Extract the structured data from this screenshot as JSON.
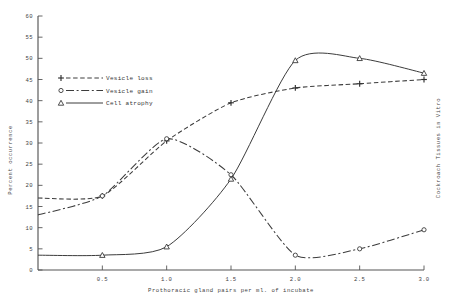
{
  "chart_data": {
    "type": "line",
    "title": "",
    "xlabel": "Prothoracic gland pairs per ml. of incubate",
    "ylabel": "Percent occurrence",
    "right_label": "Cockroach Tissues in Vitro",
    "xlim": [
      0,
      3.0
    ],
    "ylim": [
      0,
      60
    ],
    "xticks": [
      0.5,
      1.0,
      1.5,
      2.0,
      2.5,
      3.0
    ],
    "xticklabels": [
      "0.5",
      "1.0",
      "1.5",
      "2.0",
      "2.5",
      "3.0"
    ],
    "yticks": [
      0,
      5,
      10,
      15,
      20,
      25,
      30,
      35,
      40,
      45,
      50,
      55,
      60
    ],
    "yticklabels": [
      "0",
      "5",
      "10",
      "15",
      "20",
      "25",
      "30",
      "35",
      "40",
      "45",
      "50",
      "55",
      "60"
    ],
    "grid": false,
    "legend_position": "upper-left",
    "series": [
      {
        "name": "Vesicle loss",
        "marker": "plus",
        "linestyle": "dashed",
        "x": [
          0.0,
          0.5,
          1.0,
          1.5,
          2.0,
          2.5,
          3.0
        ],
        "y": [
          17.0,
          17.5,
          30.5,
          39.5,
          43.0,
          44.0,
          45.0
        ]
      },
      {
        "name": "Vesicle gain",
        "marker": "circle",
        "linestyle": "dashdot",
        "x": [
          0.0,
          0.5,
          1.0,
          1.5,
          2.0,
          2.5,
          3.0
        ],
        "y": [
          13.0,
          17.5,
          31.0,
          22.5,
          3.5,
          5.0,
          9.5
        ]
      },
      {
        "name": "Cell atrophy",
        "marker": "triangle",
        "linestyle": "solid",
        "x": [
          0.0,
          0.5,
          1.0,
          1.5,
          2.0,
          2.5,
          3.0
        ],
        "y": [
          3.5,
          3.5,
          5.5,
          21.5,
          49.5,
          50.0,
          46.5
        ]
      }
    ]
  },
  "legend": {
    "items": [
      {
        "label": "Vesicle loss",
        "marker": "plus",
        "style": "dashed"
      },
      {
        "label": "Vesicle gain",
        "marker": "circle",
        "style": "dashdot"
      },
      {
        "label": "Cell atrophy",
        "marker": "triangle",
        "style": "solid"
      }
    ]
  }
}
